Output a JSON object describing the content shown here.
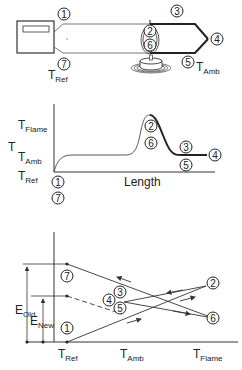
{
  "panel_top": {
    "title": "thermocouple-setup",
    "markers": [
      "1",
      "2",
      "3",
      "4",
      "5",
      "6",
      "7"
    ],
    "labels": {
      "t_ref": {
        "T": "T",
        "sub": "Ref"
      },
      "t_amb": {
        "T": "T",
        "sub": "Amb"
      }
    }
  },
  "panel_middle": {
    "y_axis_label": "T",
    "y_ticks": [
      {
        "T": "T",
        "sub": "Flame"
      },
      {
        "T": "T",
        "sub": "Amb"
      },
      {
        "T": "T",
        "sub": "Ref"
      }
    ],
    "x_axis_label": "Length",
    "markers": [
      "1",
      "7",
      "2",
      "6",
      "3",
      "5",
      "4"
    ]
  },
  "panel_bottom": {
    "x_ticks": [
      {
        "T": "T",
        "sub": "Ref"
      },
      {
        "T": "T",
        "sub": "Amb"
      },
      {
        "T": "T",
        "sub": "Flame"
      }
    ],
    "emf_labels": {
      "old": {
        "E": "E",
        "sub": "Old"
      },
      "new": {
        "E": "E",
        "sub": "New"
      }
    },
    "markers": [
      "7",
      "1",
      "3",
      "4",
      "5",
      "2",
      "6"
    ]
  }
}
